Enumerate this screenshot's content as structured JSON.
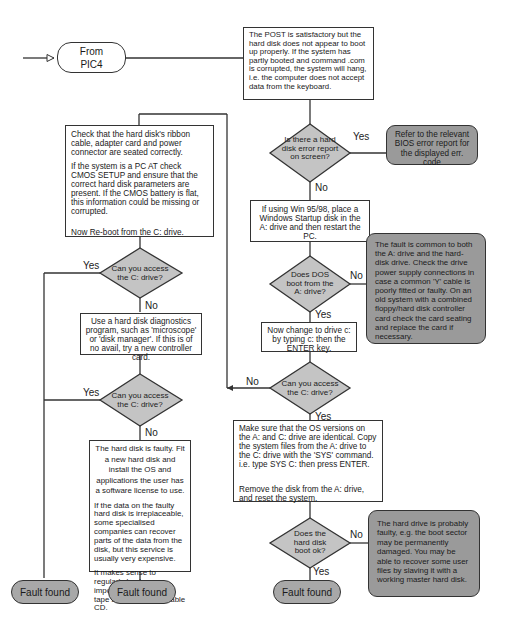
{
  "flowchart": {
    "start": {
      "label_line1": "From",
      "label_line2": "PIC4"
    },
    "post_box": {
      "text": "The POST is satisfactory but the hard disk does not appear to boot up properly. If the system has partly booted and command .com is corrupted, the system will hang, i.e. the computer does not accept data from the keyboard."
    },
    "decision_error_report": {
      "text": "Is there a hard disk error report on screen?",
      "yes": "Yes",
      "no": "No"
    },
    "note_bios": {
      "text": "Refer to the relevant BIOS error report for the displayed err. code"
    },
    "box_win_startup": {
      "text": "If using Win 95/98, place a Windows Startup disk in the A: drive and then restart the PC."
    },
    "decision_dos_boot": {
      "text": "Does DOS boot from the A: drive?",
      "yes": "Yes",
      "no": "No"
    },
    "note_common_fault": {
      "text": "The fault is common to both the A: drive and the hard-disk drive. Check the drive power supply connections in case a common 'Y' cable is poorly fitted or faulty. On an old system with a combined floppy/hard disk controller card check the card seating and replace the card if necessary."
    },
    "box_change_drive": {
      "text": "Now change to drive c: by typing c: then the ENTER key."
    },
    "decision_access_c_right": {
      "text": "Can you access the C: drive?",
      "yes": "Yes",
      "no": "No"
    },
    "box_sys": {
      "para1": "Make sure that the OS versions on the A: and C: drive are identical. Copy the system files from the A: drive to the C: drive with the 'SYS' command. i.e. type SYS C: then press ENTER.",
      "para2": "Remove the disk from the A: drive, and reset the system."
    },
    "decision_hd_boot": {
      "text": "Does the hard disk boot ok?",
      "yes": "Yes",
      "no": "No"
    },
    "note_hd_faulty": {
      "text": "The hard drive is probably faulty, e.g. the boot sector may be permanently damaged. You may be able to recover some user files by slaving it with a working master hard disk."
    },
    "box_check_cable": {
      "para1": "Check that the hard disk's ribbon cable, adapter card and power connector are seated correctly.",
      "para2": "If the system is a PC AT check CMOS SETUP and ensure that the correct hard disk parameters are present. If the CMOS battery is flat, this information could be missing or corrupted.",
      "para3": "Now Re-boot from the C: drive."
    },
    "decision_access_c_left1": {
      "text": "Can you access the C: drive?",
      "yes": "Yes",
      "no": "No"
    },
    "box_diagnostics": {
      "text": "Use a hard disk diagnostics program, such as 'microscope' or 'disk manager'. If this is of no avail, try a new controller card."
    },
    "decision_access_c_left2": {
      "text": "Can you access the C: drive?",
      "yes": "Yes",
      "no": "No"
    },
    "box_faulty_disk": {
      "para1": "The hard disk is faulty. Fit a new hard disk and install the OS and applications the user has a software license to use.",
      "para2": "If the data on the faulty hard disk is irreplaceable, some specialised companies can recover parts of the data from the disk, but this service is usually very expensive.",
      "para3": "It makes sense to regularly backup important data onto a tape streamer of writeable CD."
    },
    "terminals": [
      {
        "label": "Fault found"
      },
      {
        "label": "Fault found"
      },
      {
        "label": "Fault found"
      }
    ],
    "colors": {
      "shape_grey": "#a8a8a8",
      "note_grey": "#9a9a9a",
      "diamond_grey": "#c4c4c4",
      "line": "#333333"
    }
  }
}
